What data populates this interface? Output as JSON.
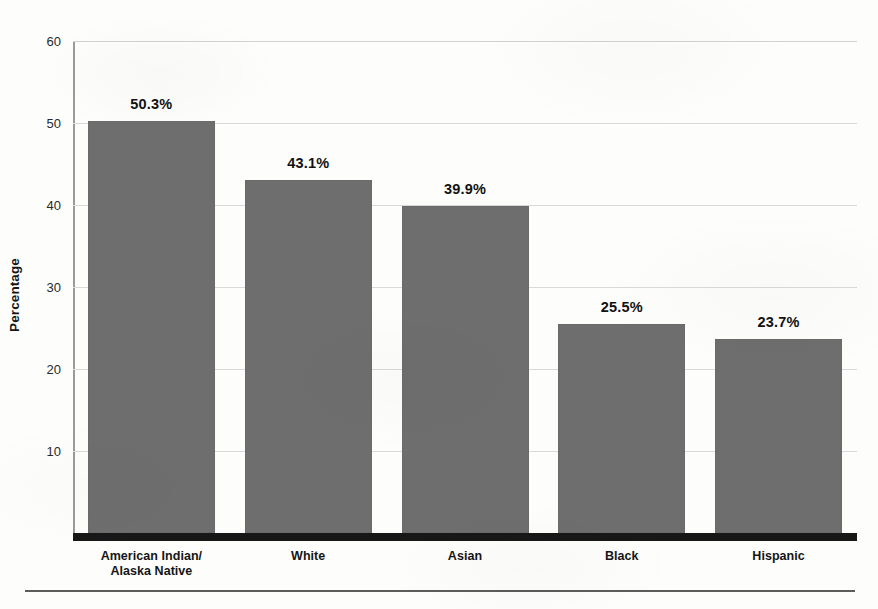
{
  "chart_data": {
    "type": "bar",
    "title": "",
    "xlabel": "",
    "ylabel": "Percentage",
    "ylim": [
      0,
      60
    ],
    "yticks": [
      60,
      50,
      40,
      30,
      20,
      10
    ],
    "ytick_labels": [
      "60",
      "50",
      "40",
      "30",
      "20",
      "10"
    ],
    "grid": true,
    "legend": "none",
    "categories": [
      "American Indian/\nAlaska Native",
      "White",
      "Asian",
      "Black",
      "Hispanic"
    ],
    "category_lines": [
      [
        "American Indian/",
        "Alaska Native"
      ],
      [
        "White"
      ],
      [
        "Asian"
      ],
      [
        "Black"
      ],
      [
        "Hispanic"
      ]
    ],
    "values": [
      50.3,
      43.1,
      39.9,
      25.5,
      23.7
    ],
    "value_labels": [
      "50.3%",
      "43.1%",
      "39.9%",
      "25.5%",
      "23.7%"
    ],
    "bar_color": "#6e6e6e",
    "gridline_color": "#d9d9d9",
    "axis_color": "#9a9a9a",
    "baseline_color": "#171717",
    "text_color": "#111111"
  }
}
